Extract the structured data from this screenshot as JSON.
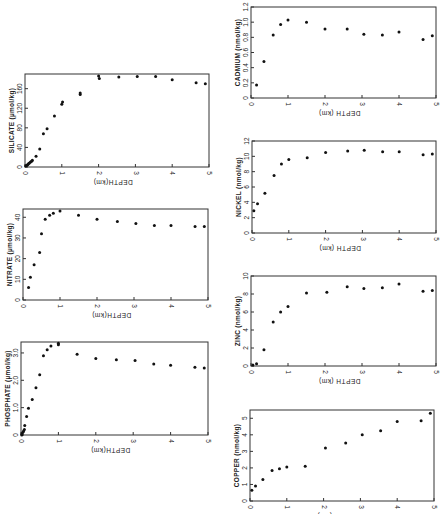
{
  "figure": {
    "orientation": "rotated",
    "caption_visible": false
  },
  "chart_data": [
    {
      "id": "silicate",
      "type": "scatter",
      "title": "",
      "ylabel": "SILICATE (µmol/kg)",
      "xlabel": "DEPTH(km)",
      "xlim": [
        0,
        5
      ],
      "ylim": [
        0,
        190
      ],
      "xticks": [
        "0",
        "1",
        "2",
        "3",
        "4",
        "5"
      ],
      "yticks": [
        {
          "v": 0,
          "label": "0"
        },
        {
          "v": 40,
          "label": "40"
        },
        {
          "v": 80,
          "label": "80"
        },
        {
          "v": 120,
          "label": "120"
        },
        {
          "v": 160,
          "label": "160"
        }
      ],
      "frame": {
        "left": 25,
        "top": 74,
        "width": 184,
        "height": 93
      },
      "points": [
        [
          0.02,
          2
        ],
        [
          0.04,
          3
        ],
        [
          0.06,
          4
        ],
        [
          0.08,
          5
        ],
        [
          0.1,
          7
        ],
        [
          0.12,
          8
        ],
        [
          0.15,
          10
        ],
        [
          0.18,
          12
        ],
        [
          0.2,
          14
        ],
        [
          0.3,
          22
        ],
        [
          0.4,
          37
        ],
        [
          0.5,
          68
        ],
        [
          0.6,
          78
        ],
        [
          0.8,
          104
        ],
        [
          1.0,
          128
        ],
        [
          1.02,
          133
        ],
        [
          1.5,
          148
        ],
        [
          1.5,
          151
        ],
        [
          2.0,
          186
        ],
        [
          2.02,
          181
        ],
        [
          2.55,
          184
        ],
        [
          3.05,
          185
        ],
        [
          3.55,
          185
        ],
        [
          4.0,
          178
        ],
        [
          4.65,
          172
        ],
        [
          4.9,
          170
        ]
      ]
    },
    {
      "id": "nitrate",
      "type": "scatter",
      "title": "",
      "ylabel": "NITRATE (µmol/kg)",
      "xlabel": "DEPTH(km)",
      "xlim": [
        0,
        5
      ],
      "ylim": [
        0,
        44
      ],
      "xticks": [
        "0",
        "1",
        "2",
        "3",
        "4",
        "5"
      ],
      "yticks": [
        {
          "v": 0,
          "label": "0"
        },
        {
          "v": 10,
          "label": "10"
        },
        {
          "v": 20,
          "label": "20"
        },
        {
          "v": 30,
          "label": "30"
        },
        {
          "v": 40,
          "label": "40"
        }
      ],
      "frame": {
        "left": 23,
        "top": 209,
        "width": 185,
        "height": 91
      },
      "points": [
        [
          0.15,
          6
        ],
        [
          0.2,
          11
        ],
        [
          0.3,
          17
        ],
        [
          0.45,
          23
        ],
        [
          0.5,
          32
        ],
        [
          0.6,
          39
        ],
        [
          0.72,
          41
        ],
        [
          0.82,
          42
        ],
        [
          1.0,
          43
        ],
        [
          1.5,
          41
        ],
        [
          2.0,
          39
        ],
        [
          2.55,
          38
        ],
        [
          3.05,
          37
        ],
        [
          3.55,
          36
        ],
        [
          4.0,
          36
        ],
        [
          4.65,
          35.5
        ],
        [
          4.9,
          35.5
        ]
      ]
    },
    {
      "id": "phosphate",
      "type": "scatter",
      "title": "",
      "ylabel": "PHOSPHATE (µmol/kg)",
      "xlabel": "DEPTH(km)",
      "xlim": [
        0,
        5
      ],
      "ylim": [
        0,
        3.4
      ],
      "xticks": [
        "0",
        "1",
        "2",
        "3",
        "4",
        "5"
      ],
      "yticks": [
        {
          "v": 0,
          "label": "0"
        },
        {
          "v": 1.0,
          "label": "1.0"
        },
        {
          "v": 2.0,
          "label": "2.0"
        },
        {
          "v": 3.0,
          "label": "3.0"
        }
      ],
      "frame": {
        "left": 21,
        "top": 342,
        "width": 187,
        "height": 93
      },
      "points": [
        [
          0.02,
          0.0
        ],
        [
          0.03,
          0.05
        ],
        [
          0.05,
          0.1
        ],
        [
          0.07,
          0.15
        ],
        [
          0.09,
          0.2
        ],
        [
          0.1,
          0.35
        ],
        [
          0.15,
          0.68
        ],
        [
          0.2,
          0.98
        ],
        [
          0.3,
          1.3
        ],
        [
          0.4,
          1.73
        ],
        [
          0.5,
          2.2
        ],
        [
          0.6,
          2.9
        ],
        [
          0.7,
          3.12
        ],
        [
          0.8,
          3.25
        ],
        [
          1.0,
          3.3
        ],
        [
          1.0,
          3.35
        ],
        [
          1.5,
          2.95
        ],
        [
          2.0,
          2.8
        ],
        [
          2.55,
          2.75
        ],
        [
          3.05,
          2.72
        ],
        [
          3.55,
          2.6
        ],
        [
          4.0,
          2.55
        ],
        [
          4.65,
          2.48
        ],
        [
          4.9,
          2.45
        ]
      ]
    },
    {
      "id": "cadmium",
      "type": "scatter",
      "title": "",
      "ylabel": "CADMIUM (nmol/kg)",
      "xlabel": "DEPTH (km)",
      "xlim": [
        0,
        5
      ],
      "ylim": [
        0,
        1.2
      ],
      "xticks": [
        "0",
        "1",
        "2",
        "3",
        "4",
        "5"
      ],
      "yticks": [
        {
          "v": 0,
          "label": "0"
        },
        {
          "v": 0.2,
          "label": "0.2"
        },
        {
          "v": 0.4,
          "label": "0.4"
        },
        {
          "v": 0.6,
          "label": "0.6"
        },
        {
          "v": 0.8,
          "label": "0.8"
        },
        {
          "v": 1.0,
          "label": "1.0"
        },
        {
          "v": 1.2,
          "label": "1.2"
        }
      ],
      "frame": {
        "left": 251,
        "top": 7,
        "width": 185,
        "height": 91
      },
      "points": [
        [
          0.15,
          0.17
        ],
        [
          0.35,
          0.48
        ],
        [
          0.6,
          0.83
        ],
        [
          0.8,
          0.97
        ],
        [
          1.0,
          1.03
        ],
        [
          1.5,
          1.0
        ],
        [
          2.0,
          0.91
        ],
        [
          2.6,
          0.91
        ],
        [
          3.05,
          0.84
        ],
        [
          3.55,
          0.83
        ],
        [
          4.0,
          0.87
        ],
        [
          4.65,
          0.77
        ],
        [
          4.9,
          0.82
        ]
      ]
    },
    {
      "id": "nickel",
      "type": "scatter",
      "title": "",
      "ylabel": "NICKEL (nmol/kg)",
      "xlabel": "DEPTH (km)",
      "xlim": [
        0,
        5
      ],
      "ylim": [
        0,
        12
      ],
      "xticks": [
        "0",
        "1",
        "2",
        "3",
        "4",
        "5"
      ],
      "yticks": [
        {
          "v": 0,
          "label": "0"
        },
        {
          "v": 2,
          "label": "2"
        },
        {
          "v": 4,
          "label": "4"
        },
        {
          "v": 6,
          "label": "6"
        },
        {
          "v": 8,
          "label": "8"
        },
        {
          "v": 10,
          "label": "10"
        },
        {
          "v": 12,
          "label": "12"
        }
      ],
      "frame": {
        "left": 252,
        "top": 141,
        "width": 184,
        "height": 92
      },
      "points": [
        [
          0.05,
          2.9
        ],
        [
          0.15,
          3.8
        ],
        [
          0.35,
          5.2
        ],
        [
          0.6,
          7.5
        ],
        [
          0.8,
          9.0
        ],
        [
          1.0,
          9.6
        ],
        [
          1.5,
          9.8
        ],
        [
          2.0,
          10.5
        ],
        [
          2.6,
          10.7
        ],
        [
          3.05,
          10.8
        ],
        [
          3.55,
          10.6
        ],
        [
          4.0,
          10.6
        ],
        [
          4.65,
          10.2
        ],
        [
          4.9,
          10.3
        ]
      ]
    },
    {
      "id": "zinc",
      "type": "scatter",
      "title": "",
      "ylabel": "ZINC (nmol/kg)",
      "xlabel": "DEPTH (km)",
      "xlim": [
        0,
        5
      ],
      "ylim": [
        0,
        10
      ],
      "xticks": [
        "0",
        "1",
        "2",
        "3",
        "4",
        "5"
      ],
      "yticks": [
        {
          "v": 0,
          "label": "0"
        },
        {
          "v": 2,
          "label": "2"
        },
        {
          "v": 4,
          "label": "4"
        },
        {
          "v": 6,
          "label": "6"
        },
        {
          "v": 8,
          "label": "8"
        },
        {
          "v": 10,
          "label": "10"
        }
      ],
      "frame": {
        "left": 251,
        "top": 276,
        "width": 185,
        "height": 90
      },
      "points": [
        [
          0.05,
          0.1
        ],
        [
          0.15,
          0.25
        ],
        [
          0.35,
          1.8
        ],
        [
          0.6,
          4.9
        ],
        [
          0.8,
          6.0
        ],
        [
          1.0,
          6.6
        ],
        [
          1.5,
          8.1
        ],
        [
          2.05,
          8.2
        ],
        [
          2.6,
          8.8
        ],
        [
          3.05,
          8.6
        ],
        [
          3.55,
          8.7
        ],
        [
          4.0,
          9.1
        ],
        [
          4.65,
          8.3
        ],
        [
          4.9,
          8.4
        ]
      ]
    },
    {
      "id": "copper",
      "type": "scatter",
      "title": "",
      "ylabel": "COPPER (nmol/kg)",
      "xlabel": "DEPTH (km)",
      "xlim": [
        0,
        5
      ],
      "ylim": [
        0,
        5.5
      ],
      "xticks": [
        "0",
        "1",
        "2",
        "3",
        "4",
        "5"
      ],
      "yticks": [
        {
          "v": 0,
          "label": "0"
        },
        {
          "v": 1,
          "label": "1"
        },
        {
          "v": 2,
          "label": "2"
        },
        {
          "v": 3,
          "label": "3"
        },
        {
          "v": 4,
          "label": "4"
        },
        {
          "v": 5,
          "label": "5"
        }
      ],
      "frame": {
        "left": 250,
        "top": 410,
        "width": 184,
        "height": 91
      },
      "points": [
        [
          0.05,
          0.65
        ],
        [
          0.15,
          0.9
        ],
        [
          0.35,
          1.3
        ],
        [
          0.6,
          1.85
        ],
        [
          0.8,
          1.95
        ],
        [
          1.0,
          2.05
        ],
        [
          1.5,
          2.1
        ],
        [
          2.05,
          3.2
        ],
        [
          2.6,
          3.5
        ],
        [
          3.05,
          4.0
        ],
        [
          3.55,
          4.25
        ],
        [
          4.0,
          4.8
        ],
        [
          4.65,
          4.85
        ],
        [
          4.9,
          5.3
        ]
      ]
    }
  ]
}
